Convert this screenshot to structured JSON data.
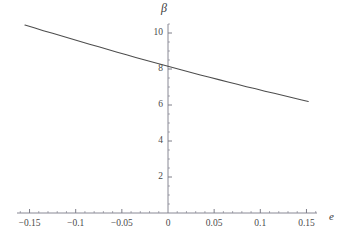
{
  "figure": {
    "background": "#ffffff",
    "line_color": "#4d4d4d",
    "axis_color": "#7a7a88",
    "tick_text_color": "#4a4a4a"
  },
  "chart_data": {
    "type": "line",
    "title": "",
    "subtitle": "",
    "xlabel": "e",
    "ylabel": "β",
    "xlim": [
      -0.1625,
      0.1625
    ],
    "ylim": [
      0,
      11.1
    ],
    "grid": false,
    "legend": null,
    "axis_style": "mathematica-cross-axes",
    "x_axis_position": 0,
    "y_axis_position": 0,
    "xticks": [
      -0.15,
      -0.1,
      -0.05,
      0,
      0.05,
      0.1,
      0.15
    ],
    "xticklabels": [
      "-0.15",
      "-0.1",
      "-0.05",
      "0",
      "0.05",
      "0.1",
      "0.15"
    ],
    "yticks": [
      2,
      4,
      6,
      8,
      10
    ],
    "yticklabels": [
      "2",
      "4",
      "6",
      "8",
      "10"
    ],
    "x_minor_tick_step": 0.01,
    "y_minor_tick_step": 0.5,
    "series": [
      {
        "name": "beta(e)",
        "x": [
          -0.155,
          -0.145,
          -0.135,
          -0.125,
          -0.115,
          -0.105,
          -0.095,
          -0.085,
          -0.075,
          -0.065,
          -0.055,
          -0.045,
          -0.035,
          -0.025,
          -0.015,
          -0.005,
          0.0,
          0.005,
          0.015,
          0.025,
          0.035,
          0.045,
          0.055,
          0.065,
          0.075,
          0.085,
          0.095,
          0.105,
          0.115,
          0.125,
          0.135,
          0.145,
          0.152
        ],
        "y": [
          10.44,
          10.29,
          10.13,
          9.98,
          9.83,
          9.68,
          9.53,
          9.38,
          9.23,
          9.08,
          8.93,
          8.79,
          8.64,
          8.5,
          8.36,
          8.22,
          8.15,
          8.08,
          7.94,
          7.81,
          7.67,
          7.54,
          7.41,
          7.28,
          7.15,
          7.02,
          6.9,
          6.77,
          6.65,
          6.53,
          6.4,
          6.28,
          6.2
        ]
      }
    ],
    "endpoints": {
      "left": {
        "x": -0.155,
        "y": 10.44
      },
      "right": {
        "x": 0.152,
        "y": 5.85
      }
    },
    "y_intercept": 8.15
  },
  "labels": {
    "y_axis_symbol": "β",
    "x_axis_symbol": "e"
  }
}
